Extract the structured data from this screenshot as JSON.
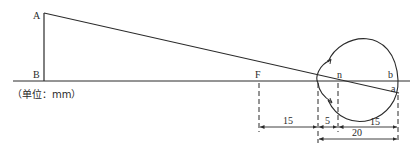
{
  "diagram": {
    "unit_label": "（单位：mm）",
    "points": {
      "A": "A",
      "B": "B",
      "F": "F",
      "n": "n",
      "a": "a",
      "b": "b"
    },
    "dimensions": {
      "F_to_cornea": "15",
      "cornea_to_n": "5",
      "n_to_retina": "15",
      "cornea_to_retina": "20"
    },
    "colors": {
      "stroke": "#2a2a2a",
      "background": "#ffffff"
    }
  }
}
